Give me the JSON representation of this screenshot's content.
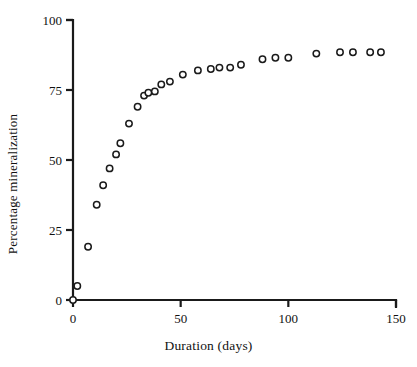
{
  "chart_data": {
    "type": "scatter",
    "title": "",
    "subtitle": "",
    "xlabel": "Duration (days)",
    "ylabel": "Percentage mineralization",
    "xlim": [
      0,
      150
    ],
    "ylim": [
      0,
      100
    ],
    "xticks": [
      0,
      50,
      100,
      150
    ],
    "yticks": [
      0,
      25,
      50,
      75,
      100
    ],
    "xtick_labels": [
      "0",
      "50",
      "100",
      "150"
    ],
    "ytick_labels": [
      "0",
      "25",
      "50",
      "75",
      "100"
    ],
    "grid": false,
    "legend": null,
    "marker": "open-circle",
    "marker_color": "#1a1a1a",
    "marker_fill": "#ffffff",
    "axis_color": "#1a1a1a",
    "background": "#ffffff",
    "series": [
      {
        "name": "Percentage mineralization",
        "x": [
          0,
          2,
          7,
          11,
          14,
          17,
          20,
          22,
          26,
          30,
          33,
          35,
          38,
          41,
          45,
          51,
          58,
          64,
          68,
          73,
          78,
          88,
          94,
          100,
          113,
          124,
          130,
          138,
          143
        ],
        "y": [
          0,
          5,
          19,
          34,
          41,
          47,
          52,
          56,
          63,
          69,
          73,
          74,
          74.5,
          77,
          78,
          80.5,
          82,
          82.5,
          83,
          83,
          84,
          86,
          86.5,
          86.5,
          88,
          88.5,
          88.5,
          88.5,
          88.5
        ]
      }
    ]
  },
  "figure": {
    "xlabel_text": "Duration (days)",
    "ylabel_text": "Percentage mineralization"
  }
}
